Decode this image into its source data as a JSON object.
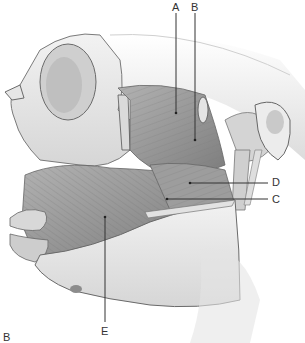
{
  "figure": {
    "panel_label": "B",
    "labels": [
      {
        "id": "A",
        "text": "A",
        "x": 172,
        "y": 2,
        "pointer": {
          "x1": 176,
          "y1": 13,
          "x2": 176,
          "y2": 113
        }
      },
      {
        "id": "B",
        "text": "B",
        "x": 191,
        "y": 2,
        "pointer": {
          "x1": 195,
          "y1": 13,
          "x2": 195,
          "y2": 140
        }
      },
      {
        "id": "D",
        "text": "D",
        "x": 272,
        "y": 177,
        "pointer": {
          "x1": 190,
          "y1": 183,
          "x2": 268,
          "y2": 183
        }
      },
      {
        "id": "C",
        "text": "C",
        "x": 272,
        "y": 194,
        "pointer": {
          "x1": 167,
          "y1": 199,
          "x2": 268,
          "y2": 199
        }
      },
      {
        "id": "E",
        "text": "E",
        "x": 101,
        "y": 326,
        "pointer": {
          "x1": 105,
          "y1": 217,
          "x2": 105,
          "y2": 322
        }
      }
    ],
    "colors": {
      "bone": "#e9e9e9",
      "bone_shadow": "#c8c8c8",
      "muscle": "#9a9a9a",
      "muscle_dark": "#6e6e6e",
      "outline": "#6a6a6a",
      "leader_line": "#333333"
    }
  }
}
